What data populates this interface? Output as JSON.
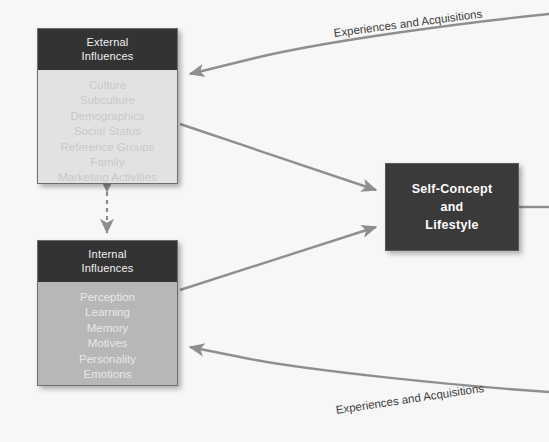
{
  "diagram": {
    "background_color": "#f7f7f7",
    "line_color": "#8f8f8f"
  },
  "external_box": {
    "header_line1": "External",
    "header_line2": "Influences",
    "header_color": "#333333",
    "body_color": "#e2e2e2",
    "items": [
      "Culture",
      "Subculture",
      "Demographics",
      "Social Status",
      "Reference Groups",
      "Family",
      "Marketing Activities"
    ]
  },
  "internal_box": {
    "header_line1": "Internal",
    "header_line2": "Influences",
    "header_color": "#333333",
    "body_color": "#b7b7b7",
    "items": [
      "Perception",
      "Learning",
      "Memory",
      "Motives",
      "Personality",
      "Emotions",
      "Attitudes"
    ]
  },
  "self_concept_box": {
    "line1": "Self-Concept",
    "line2": "and",
    "line3": "Lifestyle",
    "fill_color": "#3a3a3a",
    "text_color": "#ffffff"
  },
  "curve_labels": {
    "top": "Experiences and Acquisitions",
    "bottom": "Experiences and Acquisitions"
  }
}
